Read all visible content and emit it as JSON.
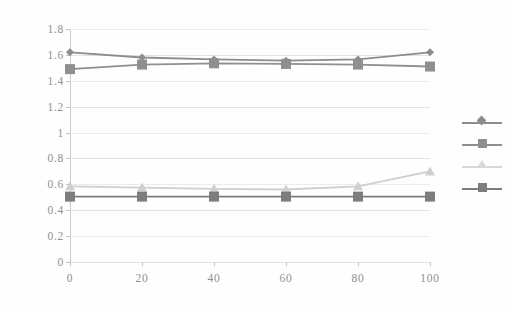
{
  "chart_data": {
    "type": "line",
    "title": "",
    "subtitle": "",
    "xlabel": "",
    "ylabel": "",
    "x": [
      0,
      20,
      40,
      60,
      80,
      100
    ],
    "xlim": [
      0,
      100
    ],
    "ylim": [
      0,
      1.8
    ],
    "xticks": [
      "0",
      "20",
      "40",
      "60",
      "80",
      "100"
    ],
    "yticks": [
      "0",
      "0.2",
      "0.4",
      "0.6",
      "0.8",
      "1",
      "1.2",
      "1.4",
      "1.6",
      "1.8"
    ],
    "grid": true,
    "legend_position": "right",
    "series": [
      {
        "name": "series-1",
        "marker": "diamond",
        "color": "#8c8c8c",
        "values": [
          1.62,
          1.58,
          1.565,
          1.555,
          1.565,
          1.62
        ]
      },
      {
        "name": "series-2",
        "marker": "square",
        "color": "#8f8f8f",
        "values": [
          1.49,
          1.525,
          1.535,
          1.53,
          1.525,
          1.51
        ]
      },
      {
        "name": "series-3",
        "marker": "triangle",
        "color": "#cfcfcf",
        "values": [
          0.585,
          0.575,
          0.565,
          0.56,
          0.585,
          0.7
        ]
      },
      {
        "name": "series-4",
        "marker": "square",
        "color": "#7d7d7d",
        "values": [
          0.505,
          0.505,
          0.505,
          0.505,
          0.505,
          0.505
        ]
      }
    ]
  },
  "legend": {
    "entries": [
      {
        "label": "",
        "marker": "diamond-marker",
        "color": "#8c8c8c"
      },
      {
        "label": "",
        "marker": "square-marker",
        "color": "#8f8f8f"
      },
      {
        "label": "",
        "marker": "triangle-marker",
        "color": "#d8d8d8"
      },
      {
        "label": "",
        "marker": "square-marker",
        "color": "#7d7d7d"
      }
    ]
  },
  "colors": {
    "background": "#fefefe",
    "gridline": "#e3e3e3",
    "axis": "#c4c4c4",
    "tick_text": "#909090"
  }
}
